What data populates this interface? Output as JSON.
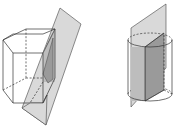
{
  "diagram": {
    "figures": [
      {
        "id": "prism",
        "label": "",
        "shape": "pentagonal-prism",
        "cut": "oblique-plane",
        "colors": {
          "plane": "#d9d9d9",
          "section": "#9a9a9a",
          "edges": "#333333"
        }
      },
      {
        "id": "cylinder",
        "label": "",
        "shape": "cylinder",
        "cut": "vertical-plane-through-axis",
        "colors": {
          "plane": "#d9d9d9",
          "section": "#9a9a9a",
          "edges": "#333333"
        }
      }
    ]
  }
}
